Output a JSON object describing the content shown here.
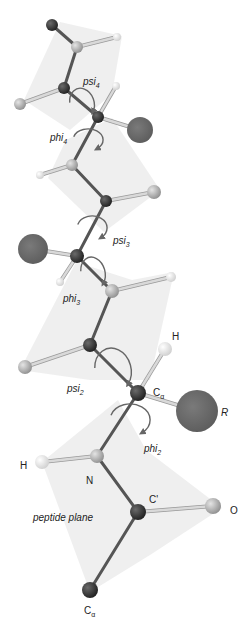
{
  "colors": {
    "background": "#ffffff",
    "plane": "#e9e9e9",
    "bond_dark": "#555555",
    "bond_light": "#d9d9d9",
    "atom_dark": "#2e2e2e",
    "atom_light": "#b3b3b3",
    "atom_h": "#eeeeee",
    "atom_r": "#6b6b6b",
    "rotation_arrow": "#666666",
    "text": "#222222"
  },
  "planes": [
    {
      "points": "60,22 122,36 112,94 70,130 24,100"
    },
    {
      "points": "66,140 112,118 160,190 104,232 48,178"
    },
    {
      "points": "76,262 132,280 174,272 150,380 90,380 20,370"
    },
    {
      "points": "118,400 146,450 222,508 150,555 90,592 42,462"
    }
  ],
  "atoms": [
    {
      "id": "ca-top",
      "type": "dark",
      "x": 52,
      "y": 25,
      "r": 6
    },
    {
      "id": "n-4",
      "type": "light",
      "x": 77,
      "y": 47,
      "r": 6
    },
    {
      "id": "h-n4",
      "type": "h",
      "x": 117,
      "y": 37,
      "r": 4
    },
    {
      "id": "c-4",
      "type": "dark",
      "x": 64,
      "y": 88,
      "r": 6
    },
    {
      "id": "o-4",
      "type": "light",
      "x": 20,
      "y": 104,
      "r": 6
    },
    {
      "id": "ca-4",
      "type": "dark",
      "x": 98,
      "y": 117,
      "r": 6
    },
    {
      "id": "h-ca4",
      "type": "h",
      "x": 116,
      "y": 86,
      "r": 4
    },
    {
      "id": "r-4",
      "type": "r",
      "x": 140,
      "y": 130,
      "r": 13
    },
    {
      "id": "n-3",
      "type": "light",
      "x": 72,
      "y": 165,
      "r": 6
    },
    {
      "id": "h-n3",
      "type": "h",
      "x": 40,
      "y": 175,
      "r": 4
    },
    {
      "id": "c-3",
      "type": "dark",
      "x": 106,
      "y": 201,
      "r": 6
    },
    {
      "id": "o-3",
      "type": "light",
      "x": 154,
      "y": 192,
      "r": 7
    },
    {
      "id": "ca-3",
      "type": "dark",
      "x": 77,
      "y": 256,
      "r": 7
    },
    {
      "id": "r-3",
      "type": "r",
      "x": 33,
      "y": 249,
      "r": 15
    },
    {
      "id": "h-ca3",
      "type": "h",
      "x": 60,
      "y": 282,
      "r": 4
    },
    {
      "id": "n-2",
      "type": "light",
      "x": 112,
      "y": 291,
      "r": 7
    },
    {
      "id": "h-n2",
      "type": "h",
      "x": 171,
      "y": 277,
      "r": 5
    },
    {
      "id": "c-2",
      "type": "dark",
      "x": 90,
      "y": 345,
      "r": 7
    },
    {
      "id": "o-2",
      "type": "light",
      "x": 25,
      "y": 367,
      "r": 7
    },
    {
      "id": "ca-2",
      "type": "dark",
      "x": 138,
      "y": 393,
      "r": 8
    },
    {
      "id": "h-ca2",
      "type": "h",
      "x": 165,
      "y": 349,
      "r": 7
    },
    {
      "id": "r-2",
      "type": "r",
      "x": 197,
      "y": 411,
      "r": 21
    },
    {
      "id": "n-1",
      "type": "light",
      "x": 97,
      "y": 456,
      "r": 7
    },
    {
      "id": "h-n1",
      "type": "h",
      "x": 42,
      "y": 462,
      "r": 7
    },
    {
      "id": "c-1",
      "type": "dark",
      "x": 138,
      "y": 512,
      "r": 8
    },
    {
      "id": "o-1",
      "type": "light",
      "x": 213,
      "y": 506,
      "r": 8
    },
    {
      "id": "ca-1",
      "type": "dark",
      "x": 90,
      "y": 590,
      "r": 8
    }
  ],
  "bonds": [
    {
      "a": "ca-top",
      "b": "n-4",
      "kind": "dark"
    },
    {
      "a": "n-4",
      "b": "h-n4",
      "kind": "light"
    },
    {
      "a": "n-4",
      "b": "c-4",
      "kind": "dark"
    },
    {
      "a": "c-4",
      "b": "o-4",
      "kind": "light"
    },
    {
      "a": "c-4",
      "b": "ca-4",
      "kind": "dark"
    },
    {
      "a": "ca-4",
      "b": "h-ca4",
      "kind": "light"
    },
    {
      "a": "ca-4",
      "b": "r-4",
      "kind": "light"
    },
    {
      "a": "ca-4",
      "b": "n-3",
      "kind": "dark"
    },
    {
      "a": "n-3",
      "b": "h-n3",
      "kind": "light"
    },
    {
      "a": "n-3",
      "b": "c-3",
      "kind": "dark"
    },
    {
      "a": "c-3",
      "b": "o-3",
      "kind": "light"
    },
    {
      "a": "c-3",
      "b": "ca-3",
      "kind": "dark"
    },
    {
      "a": "ca-3",
      "b": "r-3",
      "kind": "light"
    },
    {
      "a": "ca-3",
      "b": "h-ca3",
      "kind": "light"
    },
    {
      "a": "ca-3",
      "b": "n-2",
      "kind": "dark"
    },
    {
      "a": "n-2",
      "b": "h-n2",
      "kind": "light"
    },
    {
      "a": "n-2",
      "b": "c-2",
      "kind": "dark"
    },
    {
      "a": "c-2",
      "b": "o-2",
      "kind": "light"
    },
    {
      "a": "c-2",
      "b": "ca-2",
      "kind": "dark"
    },
    {
      "a": "ca-2",
      "b": "h-ca2",
      "kind": "light"
    },
    {
      "a": "ca-2",
      "b": "r-2",
      "kind": "light"
    },
    {
      "a": "ca-2",
      "b": "n-1",
      "kind": "dark"
    },
    {
      "a": "n-1",
      "b": "h-n1",
      "kind": "light"
    },
    {
      "a": "n-1",
      "b": "c-1",
      "kind": "dark"
    },
    {
      "a": "c-1",
      "b": "o-1",
      "kind": "light"
    },
    {
      "a": "c-1",
      "b": "ca-1",
      "kind": "dark"
    }
  ],
  "rotations": [
    {
      "name": "psi4",
      "cx": 82,
      "cy": 103,
      "rx": 12,
      "ry": 15,
      "angle": -20
    },
    {
      "name": "phi4",
      "cx": 88,
      "cy": 140,
      "rx": 15,
      "ry": 11,
      "angle": 0
    },
    {
      "name": "psi3",
      "cx": 92,
      "cy": 228,
      "rx": 15,
      "ry": 12,
      "angle": 0
    },
    {
      "name": "phi3",
      "cx": 93,
      "cy": 273,
      "rx": 12,
      "ry": 16,
      "angle": -15
    },
    {
      "name": "psi2",
      "cx": 113,
      "cy": 370,
      "rx": 18,
      "ry": 22,
      "angle": -15
    },
    {
      "name": "phi2",
      "cx": 130,
      "cy": 420,
      "rx": 20,
      "ry": 16,
      "angle": 0
    }
  ],
  "labels": {
    "psi4": {
      "base": "psi",
      "sub": "4",
      "x": 83,
      "y": 85
    },
    "phi4": {
      "base": "phi",
      "sub": "4",
      "x": 50,
      "y": 141
    },
    "psi3": {
      "base": "psi",
      "sub": "3",
      "x": 113,
      "y": 244
    },
    "phi3": {
      "base": "phi",
      "sub": "3",
      "x": 63,
      "y": 302
    },
    "psi2": {
      "base": "psi",
      "sub": "2",
      "x": 67,
      "y": 392
    },
    "phi2": {
      "base": "phi",
      "sub": "2",
      "x": 144,
      "y": 452
    },
    "h_ca2": {
      "text": "H",
      "x": 172,
      "y": 340
    },
    "ca2": {
      "base": "C",
      "sub": "α",
      "x": 153,
      "y": 396
    },
    "r2": {
      "text": "R",
      "x": 221,
      "y": 416
    },
    "h_n1": {
      "text": "H",
      "x": 20,
      "y": 469
    },
    "n1": {
      "text": "N",
      "x": 86,
      "y": 484
    },
    "c1": {
      "text": "C'",
      "x": 149,
      "y": 503
    },
    "o1": {
      "text": "O",
      "x": 230,
      "y": 514
    },
    "peptide_plane": {
      "text": "peptide plane",
      "x": 33,
      "y": 521
    },
    "ca1": {
      "base": "C",
      "sub": "α",
      "x": 84,
      "y": 614
    }
  }
}
